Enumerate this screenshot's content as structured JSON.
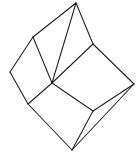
{
  "figure": {
    "title": "Wireframe cube",
    "kind": "line-drawing",
    "background_color": "#ffffff",
    "stroke_color": "#1e1e22",
    "stroke_width": 1.05,
    "canvas": {
      "width": 140,
      "height": 156
    },
    "vertex_count": 8,
    "edge_count": 12,
    "face_count": 6,
    "vertices": [
      {
        "id": "top",
        "label": "A",
        "x": 76,
        "y": 3
      },
      {
        "id": "upper-left",
        "label": "B",
        "x": 33,
        "y": 37
      },
      {
        "id": "upper-right",
        "label": "C",
        "x": 93,
        "y": 44
      },
      {
        "id": "left",
        "label": "D",
        "x": 10,
        "y": 72
      },
      {
        "id": "center-front",
        "label": "E",
        "x": 52,
        "y": 83
      },
      {
        "id": "right",
        "label": "F",
        "x": 134,
        "y": 84
      },
      {
        "id": "lower-left",
        "label": "G",
        "x": 28,
        "y": 104
      },
      {
        "id": "lower-right",
        "label": "H",
        "x": 93,
        "y": 111
      },
      {
        "id": "bottom",
        "label": "I",
        "x": 72,
        "y": 150
      }
    ],
    "edges": [
      {
        "id": "edge-top-upperleft",
        "from": "top",
        "to": "upper-left"
      },
      {
        "id": "edge-top-upperright",
        "from": "top",
        "to": "upper-right"
      },
      {
        "id": "edge-top-centerfront",
        "from": "top",
        "to": "center-front"
      },
      {
        "id": "edge-upperleft-left",
        "from": "upper-left",
        "to": "left"
      },
      {
        "id": "edge-upperleft-centerfront",
        "from": "upper-left",
        "to": "center-front"
      },
      {
        "id": "edge-upperright-right",
        "from": "upper-right",
        "to": "right"
      },
      {
        "id": "edge-upperright-centerfront",
        "from": "upper-right",
        "to": "center-front"
      },
      {
        "id": "edge-left-lowerleft",
        "from": "left",
        "to": "lower-left"
      },
      {
        "id": "edge-centerfront-lowerleft",
        "from": "center-front",
        "to": "lower-left"
      },
      {
        "id": "edge-centerfront-lowerright",
        "from": "center-front",
        "to": "lower-right"
      },
      {
        "id": "edge-right-lowerright",
        "from": "right",
        "to": "lower-right"
      },
      {
        "id": "edge-lowerleft-bottom",
        "from": "lower-left",
        "to": "bottom"
      },
      {
        "id": "edge-lowerright-bottom",
        "from": "lower-right",
        "to": "bottom"
      },
      {
        "id": "edge-right-bottom",
        "from": "right",
        "to": "bottom"
      }
    ]
  }
}
